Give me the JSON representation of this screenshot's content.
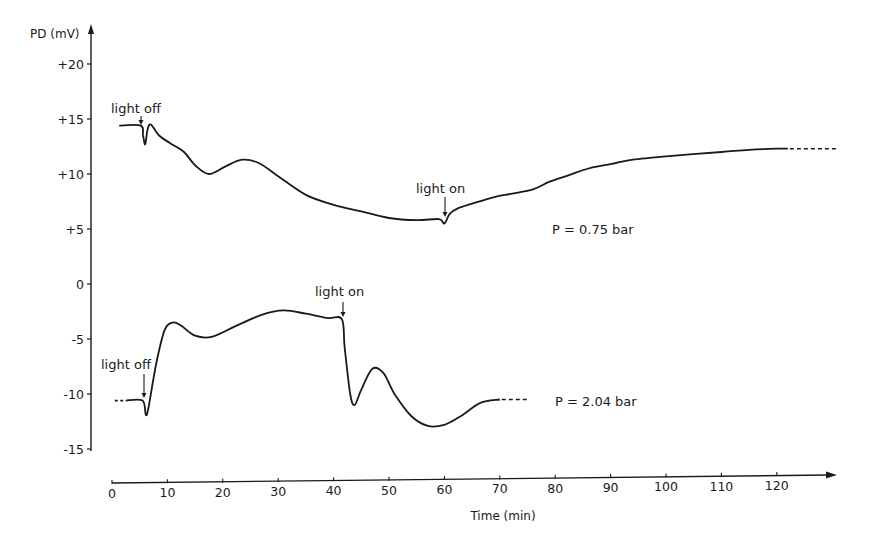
{
  "chart_data": {
    "type": "line",
    "title": "",
    "xlabel": "Time (min)",
    "ylabel": "PD (mV)",
    "xlim": [
      0,
      130
    ],
    "ylim": [
      -15,
      22
    ],
    "x_ticks": [
      0,
      10,
      20,
      30,
      40,
      50,
      60,
      70,
      80,
      90,
      100,
      110,
      120
    ],
    "x_tick_labels": [
      "0",
      "10",
      "20",
      "30",
      "40",
      "50",
      "60",
      "70",
      "80",
      "90",
      "100",
      "110",
      "120"
    ],
    "y_ticks": [
      20,
      15,
      10,
      5,
      0,
      -5,
      -10,
      -15
    ],
    "y_tick_labels": [
      "+20",
      "+15",
      "+10",
      "+5",
      "0",
      "-5",
      "-10",
      "-15"
    ],
    "grid": false,
    "legend": "none (series labeled inline)",
    "series": [
      {
        "name": "P = 0.75 bar",
        "x": [
          1.3,
          5.2,
          5.6,
          6.0,
          6.4,
          7.0,
          8.5,
          10.5,
          13,
          15,
          17.5,
          20.5,
          23.5,
          26.5,
          30,
          35,
          40,
          45,
          50,
          55,
          59,
          60,
          61,
          62.5,
          65,
          69,
          72,
          76,
          79,
          82.5,
          86,
          89,
          91,
          94,
          100,
          110,
          115,
          120,
          122
        ],
        "y": [
          14.4,
          14.4,
          13.5,
          12.7,
          14.0,
          14.5,
          13.5,
          12.8,
          12.0,
          10.8,
          10.0,
          10.7,
          11.3,
          11.0,
          9.8,
          8.1,
          7.2,
          6.6,
          6.0,
          5.8,
          5.9,
          5.5,
          6.4,
          6.9,
          7.3,
          7.9,
          8.2,
          8.6,
          9.3,
          9.9,
          10.5,
          10.8,
          11.0,
          11.3,
          11.6,
          12.0,
          12.2,
          12.3,
          12.3
        ],
        "dashed_extension_x": [
          122,
          131
        ]
      },
      {
        "name": "P = 2.04 bar",
        "x": [
          2.5,
          5.5,
          6.1,
          6.6,
          8.0,
          9.5,
          11,
          12.5,
          15,
          18,
          22,
          27,
          31,
          35,
          39,
          41.5,
          42,
          43,
          43.8,
          45,
          47,
          49,
          51,
          54,
          57,
          60,
          63,
          66.5,
          70
        ],
        "y": [
          -10.6,
          -10.6,
          -11.9,
          -11.2,
          -7.2,
          -4.2,
          -3.5,
          -3.8,
          -4.7,
          -4.8,
          -3.9,
          -2.8,
          -2.4,
          -2.7,
          -3.1,
          -3.2,
          -5.8,
          -10.0,
          -11.0,
          -9.6,
          -7.7,
          -8.1,
          -10.0,
          -12.0,
          -12.9,
          -12.8,
          -12.0,
          -10.8,
          -10.5
        ],
        "dashed_extension_x": [
          70,
          75
        ],
        "dashed_lead_in_x": [
          0.5,
          2.5
        ]
      }
    ],
    "annotations": [
      {
        "text": "light off",
        "series": "P = 0.75 bar",
        "x": 5.5,
        "arrow": "down"
      },
      {
        "text": "light on",
        "series": "P = 0.75 bar",
        "x": 60,
        "arrow": "down"
      },
      {
        "text": "light off",
        "series": "P = 2.04 bar",
        "x": 6.0,
        "arrow": "down"
      },
      {
        "text": "light on",
        "series": "P = 2.04 bar",
        "x": 41.5,
        "arrow": "down"
      }
    ]
  },
  "labels": {
    "ylabel": "PD (mV)",
    "xlabel": "Time (min)",
    "series1": "P = 0.75 bar",
    "series2": "P = 2.04 bar",
    "light_off": "light off",
    "light_on": "light on"
  }
}
